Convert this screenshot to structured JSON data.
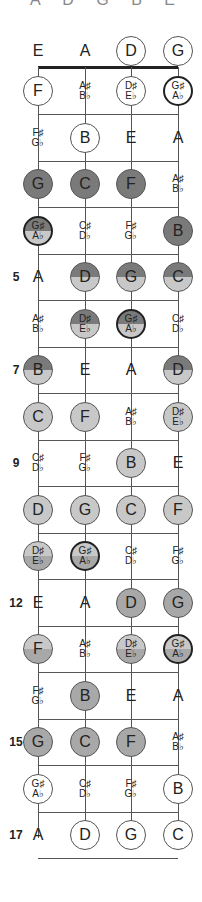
{
  "header": {
    "clipped_text": "A D G B E A C"
  },
  "strings": [
    "E",
    "A",
    "D",
    "G"
  ],
  "colors": {
    "white": "#ffffff",
    "light": "#c8c8c8",
    "mid": "#a8a8a8",
    "dark": "#7a7a7a",
    "line": "#555555"
  },
  "fret_markers": [
    {
      "fret": 5,
      "label": "5"
    },
    {
      "fret": 7,
      "label": "7"
    },
    {
      "fret": 9,
      "label": "9"
    },
    {
      "fret": 12,
      "label": "12"
    },
    {
      "fret": 15,
      "label": "15"
    },
    {
      "fret": 17,
      "label": "17"
    }
  ],
  "frets": [
    {
      "fret": 0,
      "notes": [
        {
          "text": "E",
          "style": "plain"
        },
        {
          "text": "A",
          "style": "plain"
        },
        {
          "text": "D",
          "style": "circle",
          "fill": "white"
        },
        {
          "text": "G",
          "style": "circle",
          "fill": "white"
        }
      ]
    },
    {
      "fret": 1,
      "notes": [
        {
          "text": "F",
          "style": "circle",
          "fill": "white"
        },
        {
          "text": "A♯",
          "text2": "B♭",
          "style": "plain"
        },
        {
          "text": "D♯",
          "text2": "E♭",
          "style": "circle",
          "fill": "white"
        },
        {
          "text": "G♯",
          "text2": "A♭",
          "style": "circle-bold",
          "fill": "white"
        }
      ]
    },
    {
      "fret": 2,
      "notes": [
        {
          "text": "F♯",
          "text2": "G♭",
          "style": "plain"
        },
        {
          "text": "B",
          "style": "circle",
          "fill": "white"
        },
        {
          "text": "E",
          "style": "plain"
        },
        {
          "text": "A",
          "style": "plain"
        }
      ]
    },
    {
      "fret": 3,
      "notes": [
        {
          "text": "G",
          "style": "circle",
          "fill": "dark"
        },
        {
          "text": "C",
          "style": "circle",
          "fill": "dark"
        },
        {
          "text": "F",
          "style": "circle",
          "fill": "dark"
        },
        {
          "text": "A♯",
          "text2": "B♭",
          "style": "plain"
        }
      ]
    },
    {
      "fret": 4,
      "notes": [
        {
          "text": "G♯",
          "text2": "A♭",
          "style": "circle-bold",
          "fill": "dark-light"
        },
        {
          "text": "C♯",
          "text2": "D♭",
          "style": "plain"
        },
        {
          "text": "F♯",
          "text2": "G♭",
          "style": "plain"
        },
        {
          "text": "B",
          "style": "circle",
          "fill": "dark"
        }
      ]
    },
    {
      "fret": 5,
      "notes": [
        {
          "text": "A",
          "style": "plain"
        },
        {
          "text": "D",
          "style": "circle",
          "fill": "dark-light"
        },
        {
          "text": "G",
          "style": "circle",
          "fill": "dark-light"
        },
        {
          "text": "C",
          "style": "circle",
          "fill": "dark-light"
        }
      ]
    },
    {
      "fret": 6,
      "notes": [
        {
          "text": "A♯",
          "text2": "B♭",
          "style": "plain"
        },
        {
          "text": "D♯",
          "text2": "E♭",
          "style": "circle",
          "fill": "dark-light"
        },
        {
          "text": "G♯",
          "text2": "A♭",
          "style": "circle-bold",
          "fill": "dark-light"
        },
        {
          "text": "C♯",
          "text2": "D♭",
          "style": "plain"
        }
      ]
    },
    {
      "fret": 7,
      "notes": [
        {
          "text": "B",
          "style": "circle",
          "fill": "dark-light"
        },
        {
          "text": "E",
          "style": "plain"
        },
        {
          "text": "A",
          "style": "plain"
        },
        {
          "text": "D",
          "style": "circle",
          "fill": "dark-light"
        }
      ]
    },
    {
      "fret": 8,
      "notes": [
        {
          "text": "C",
          "style": "circle",
          "fill": "light"
        },
        {
          "text": "F",
          "style": "circle",
          "fill": "light"
        },
        {
          "text": "A♯",
          "text2": "B♭",
          "style": "plain"
        },
        {
          "text": "D♯",
          "text2": "E♭",
          "style": "circle",
          "fill": "light"
        }
      ]
    },
    {
      "fret": 9,
      "notes": [
        {
          "text": "C♯",
          "text2": "D♭",
          "style": "plain"
        },
        {
          "text": "F♯",
          "text2": "G♭",
          "style": "plain"
        },
        {
          "text": "B",
          "style": "circle",
          "fill": "light"
        },
        {
          "text": "E",
          "style": "plain"
        }
      ]
    },
    {
      "fret": 10,
      "notes": [
        {
          "text": "D",
          "style": "circle",
          "fill": "light"
        },
        {
          "text": "G",
          "style": "circle",
          "fill": "light"
        },
        {
          "text": "C",
          "style": "circle",
          "fill": "light"
        },
        {
          "text": "F",
          "style": "circle",
          "fill": "light"
        }
      ]
    },
    {
      "fret": 11,
      "notes": [
        {
          "text": "D♯",
          "text2": "E♭",
          "style": "circle",
          "fill": "light-mid"
        },
        {
          "text": "G♯",
          "text2": "A♭",
          "style": "circle-bold",
          "fill": "light-mid"
        },
        {
          "text": "C♯",
          "text2": "D♭",
          "style": "plain"
        },
        {
          "text": "F♯",
          "text2": "G♭",
          "style": "plain"
        }
      ]
    },
    {
      "fret": 12,
      "notes": [
        {
          "text": "E",
          "style": "plain"
        },
        {
          "text": "A",
          "style": "plain"
        },
        {
          "text": "D",
          "style": "circle",
          "fill": "mid"
        },
        {
          "text": "G",
          "style": "circle",
          "fill": "mid"
        }
      ]
    },
    {
      "fret": 13,
      "notes": [
        {
          "text": "F",
          "style": "circle",
          "fill": "light-mid"
        },
        {
          "text": "A♯",
          "text2": "B♭",
          "style": "plain"
        },
        {
          "text": "D♯",
          "text2": "E♭",
          "style": "circle",
          "fill": "light-mid"
        },
        {
          "text": "G♯",
          "text2": "A♭",
          "style": "circle-bold",
          "fill": "light-mid"
        }
      ]
    },
    {
      "fret": 14,
      "notes": [
        {
          "text": "F♯",
          "text2": "G♭",
          "style": "plain"
        },
        {
          "text": "B",
          "style": "circle",
          "fill": "mid"
        },
        {
          "text": "E",
          "style": "plain"
        },
        {
          "text": "A",
          "style": "plain"
        }
      ]
    },
    {
      "fret": 15,
      "notes": [
        {
          "text": "G",
          "style": "circle",
          "fill": "mid"
        },
        {
          "text": "C",
          "style": "circle",
          "fill": "mid"
        },
        {
          "text": "F",
          "style": "circle",
          "fill": "mid"
        },
        {
          "text": "A♯",
          "text2": "B♭",
          "style": "plain"
        }
      ]
    },
    {
      "fret": 16,
      "notes": [
        {
          "text": "G♯",
          "text2": "A♭",
          "style": "circle",
          "fill": "white"
        },
        {
          "text": "C♯",
          "text2": "D♭",
          "style": "plain"
        },
        {
          "text": "F♯",
          "text2": "G♭",
          "style": "plain"
        },
        {
          "text": "B",
          "style": "circle",
          "fill": "white"
        }
      ]
    },
    {
      "fret": 17,
      "notes": [
        {
          "text": "A",
          "style": "plain"
        },
        {
          "text": "D",
          "style": "circle",
          "fill": "white"
        },
        {
          "text": "G",
          "style": "circle",
          "fill": "white"
        },
        {
          "text": "C",
          "style": "circle",
          "fill": "white"
        }
      ]
    }
  ]
}
